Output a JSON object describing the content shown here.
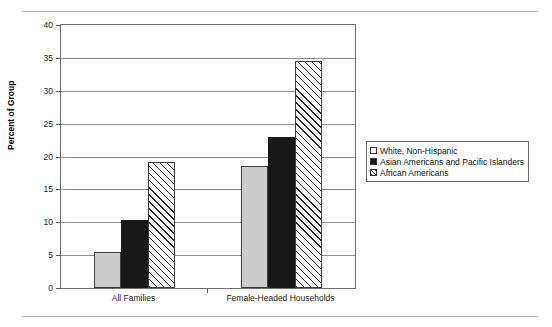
{
  "chart_data": {
    "type": "bar",
    "title": "",
    "subtitle": "",
    "xlabel": "",
    "ylabel": "Percent of Group",
    "ylim": [
      0,
      40
    ],
    "ytick_step": 5,
    "yticks": [
      "0",
      "5",
      "10",
      "15",
      "20",
      "25",
      "30",
      "35",
      "40"
    ],
    "grid": true,
    "legend_position": "right",
    "categories": [
      "All Families",
      "Female-Headed Households"
    ],
    "series": [
      {
        "name": "White, Non-Hispanic",
        "values": [
          5.5,
          18.5
        ],
        "style": "light-gray-fill",
        "color": "#cccccc"
      },
      {
        "name": "Asian Americans and Pacific Islanders",
        "values": [
          10.3,
          23.0
        ],
        "style": "solid-black-fill",
        "color": "#171717"
      },
      {
        "name": "African Americans",
        "values": [
          19.2,
          34.5
        ],
        "style": "diagonal-hatch",
        "color": "#ffffff"
      }
    ]
  },
  "legend": {
    "entries": [
      "White, Non-Hispanic",
      "Asian Americans and Pacific Islanders",
      "African Americans"
    ]
  },
  "axes": {
    "y_title": "Percent of Group",
    "y_ticks": [
      "40",
      "35",
      "30",
      "25",
      "20",
      "15",
      "10",
      "5",
      "0"
    ],
    "x_categories": [
      "All Families",
      "Female-Headed Households"
    ]
  }
}
